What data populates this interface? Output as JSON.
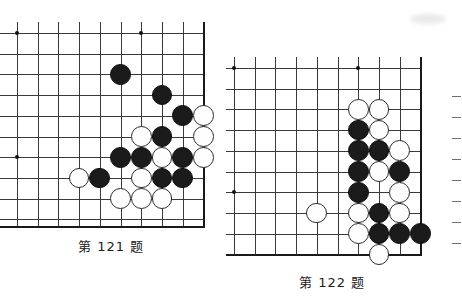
{
  "page": {
    "background_color": "#ffffff",
    "width": 462,
    "height": 301,
    "kind": "go-problem-diagram-pair"
  },
  "diagrams": [
    {
      "id": "board-121",
      "caption": "第 121 题",
      "caption_x": 78,
      "caption_y": 236,
      "origin_x": 17,
      "origin_y": 33,
      "spacing": 20.7,
      "cols": 10,
      "rows": 10,
      "right_edge_col": 9,
      "bottom_edge_row": 9.3,
      "stone_radius": 10.4,
      "star_points": [
        [
          0,
          0
        ],
        [
          6,
          0
        ],
        [
          0,
          6
        ]
      ],
      "black_stones": [
        [
          5,
          2
        ],
        [
          7,
          3
        ],
        [
          8,
          4
        ],
        [
          7,
          5
        ],
        [
          5,
          6
        ],
        [
          6,
          6
        ],
        [
          8,
          6
        ],
        [
          4,
          7
        ],
        [
          7,
          7
        ],
        [
          8,
          7
        ]
      ],
      "white_stones": [
        [
          6,
          5
        ],
        [
          9,
          5
        ],
        [
          7,
          6
        ],
        [
          9,
          6
        ],
        [
          3,
          7
        ],
        [
          6,
          7
        ],
        [
          5,
          8
        ],
        [
          6,
          8
        ],
        [
          7,
          8
        ],
        [
          9,
          4
        ]
      ]
    },
    {
      "id": "board-122",
      "caption": "第 122 题",
      "caption_x": 299,
      "caption_y": 272,
      "origin_x": 234,
      "origin_y": 68,
      "spacing": 20.7,
      "cols": 10,
      "rows": 10,
      "right_edge_col": 9,
      "bottom_edge_row": 9,
      "stone_radius": 10.4,
      "star_points": [
        [
          0,
          0
        ],
        [
          6,
          0
        ],
        [
          0,
          6
        ]
      ],
      "black_stones": [
        [
          6,
          3
        ],
        [
          6,
          4
        ],
        [
          7,
          4
        ],
        [
          6,
          5
        ],
        [
          8,
          5
        ],
        [
          6,
          6
        ],
        [
          7,
          7
        ],
        [
          7,
          8
        ],
        [
          8,
          8
        ],
        [
          9,
          8
        ]
      ],
      "white_stones": [
        [
          6,
          2
        ],
        [
          7,
          2
        ],
        [
          7,
          3
        ],
        [
          8,
          4
        ],
        [
          7,
          5
        ],
        [
          8,
          6
        ],
        [
          6,
          7
        ],
        [
          8,
          7
        ],
        [
          6,
          8
        ],
        [
          7,
          9
        ],
        [
          4,
          7
        ]
      ]
    }
  ],
  "colors": {
    "black_stone": "#1b1b1b",
    "white_stone": "#fefefe",
    "stone_outline": "#2a2a2a",
    "grid_line": "#3a3a3a",
    "board_edge": "#1a1a1a",
    "caption_text": "#1c1c1c",
    "page_background": "#ffffff"
  },
  "margin_marks": {
    "count": 8,
    "color": "#6d6d6d",
    "x": 452
  }
}
